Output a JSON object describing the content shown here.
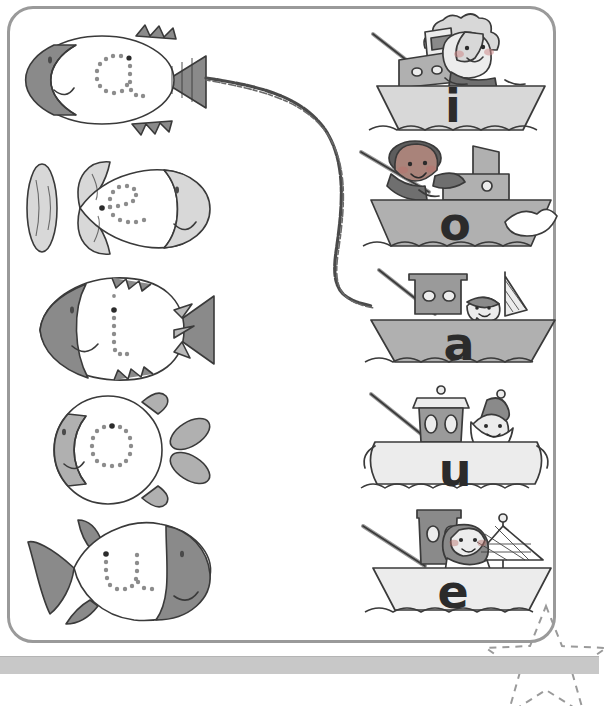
{
  "worksheet": {
    "title": "Vowel Matching Worksheet",
    "type": "match-the-letters",
    "frame_color": "#9a9a9a",
    "background": "#ffffff",
    "bottom_strip_color": "#c8c8c8"
  },
  "palette": {
    "dark_gray": "#8a8a8a",
    "mid_gray": "#b0b0b0",
    "light_gray": "#d8d8d8",
    "pale_gray": "#ececec",
    "outline": "#3a3a3a",
    "dot_color": "#8c8c8c",
    "letter_color": "#2b2b2b",
    "pencil_line": "#555555"
  },
  "fish_column": {
    "label": "fish-with-dotted-letters",
    "items": [
      {
        "letter": "a",
        "shape": "oval-fish-spiky-fins",
        "head_side": "left",
        "head_shade": "#8a8a8a",
        "body_shade": "#ffffff",
        "tail": "triangle-right"
      },
      {
        "letter": "e",
        "shape": "leaf-tail-fish",
        "head_side": "right",
        "head_shade": "#d8d8d8",
        "body_shade": "#ffffff",
        "tail": "leaf-left"
      },
      {
        "letter": "i",
        "shape": "jagged-fish",
        "head_side": "left",
        "head_shade": "#8a8a8a",
        "body_shade": "#ffffff",
        "tail": "fan-right"
      },
      {
        "letter": "o",
        "shape": "round-fish",
        "head_side": "left",
        "head_shade": "#b0b0b0",
        "body_shade": "#ffffff",
        "tail": "petal-right"
      },
      {
        "letter": "u",
        "shape": "pointed-fish",
        "head_side": "right",
        "head_shade": "#8a8a8a",
        "body_shade": "#ffffff",
        "tail": "triangle-left"
      }
    ]
  },
  "boat_column": {
    "label": "boats-with-printed-letters",
    "items": [
      {
        "letter": "i",
        "hull_shade": "#d8d8d8",
        "funnel": "striped",
        "sailor": "girl-curly-hair",
        "extras": "fishing-rod"
      },
      {
        "letter": "o",
        "hull_shade": "#b0b0b0",
        "funnel": "plain",
        "sailor": "boy-dark-curly-hair",
        "extras": "fishing-rod,spray"
      },
      {
        "letter": "a",
        "hull_shade": "#b0b0b0",
        "funnel": "portholes",
        "sailor": "sailor-with-cap",
        "extras": "fishing-rod,net-flag"
      },
      {
        "letter": "u",
        "hull_shade": "#ececec",
        "funnel": "capped",
        "sailor": "bearded-sailor-hat",
        "extras": "fishing-rod,waves"
      },
      {
        "letter": "e",
        "hull_shade": "#ececec",
        "funnel": "tall",
        "sailor": "girl-pigtails-bandana",
        "extras": "fishing-rod,fishing-net"
      }
    ]
  },
  "connection": {
    "drawn_line": "pencil-curve",
    "from": "fish-a-tail",
    "to": "boat-a",
    "style": "hand-drawn"
  },
  "star_marker": {
    "style": "dashed-outline",
    "position": "bottom-right",
    "color": "#9a9a9a"
  }
}
